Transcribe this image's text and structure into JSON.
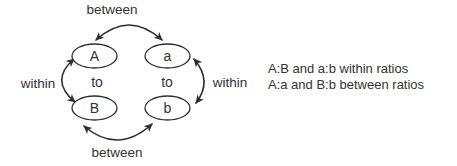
{
  "figure": {
    "colors": {
      "line": "#2e2e2e",
      "text": "#333333",
      "background": "#ffffff"
    },
    "nodes": {
      "top_left": "A",
      "top_right": "a",
      "bottom_left": "B",
      "bottom_right": "b"
    },
    "labels": {
      "top_arrow": "between",
      "bottom_arrow": "between",
      "left_arrow": "within",
      "right_arrow": "within",
      "left_connector": "to",
      "right_connector": "to"
    },
    "caption": {
      "line1": "A:B and a:b within ratios",
      "line2": "A:a and B:b between ratios"
    }
  }
}
